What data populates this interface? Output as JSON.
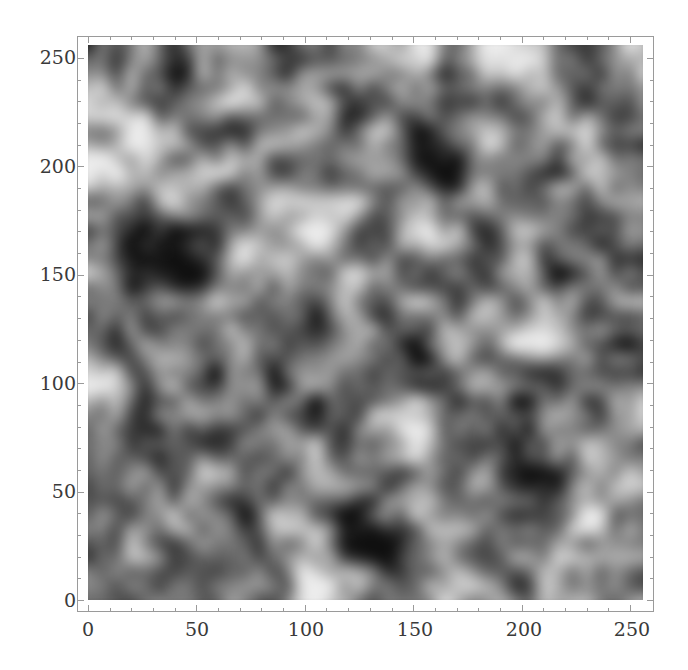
{
  "chart_data": {
    "type": "heatmap",
    "title": "",
    "xlabel": "",
    "ylabel": "",
    "xlim": [
      0,
      256
    ],
    "ylim": [
      0,
      256
    ],
    "x_ticks": [
      "0",
      "50",
      "100",
      "150",
      "200",
      "250"
    ],
    "y_ticks": [
      "0",
      "50",
      "100",
      "150",
      "200",
      "250"
    ],
    "colormap": "grayscale",
    "grid": false,
    "coarse_grid_rows_top_to_bottom": [
      [
        0.35,
        0.55,
        0.3,
        0.5,
        0.55,
        0.3,
        0.4,
        0.45,
        0.55,
        0.7,
        0.35,
        0.65,
        0.7,
        0.45,
        0.35,
        0.6
      ],
      [
        0.6,
        0.45,
        0.25,
        0.5,
        0.7,
        0.45,
        0.55,
        0.35,
        0.4,
        0.5,
        0.25,
        0.35,
        0.5,
        0.55,
        0.3,
        0.45
      ],
      [
        0.55,
        0.7,
        0.5,
        0.35,
        0.4,
        0.6,
        0.5,
        0.3,
        0.55,
        0.2,
        0.45,
        0.6,
        0.4,
        0.5,
        0.55,
        0.35
      ],
      [
        0.75,
        0.55,
        0.45,
        0.6,
        0.55,
        0.4,
        0.3,
        0.5,
        0.45,
        0.35,
        0.2,
        0.55,
        0.45,
        0.35,
        0.65,
        0.4
      ],
      [
        0.5,
        0.35,
        0.6,
        0.45,
        0.3,
        0.65,
        0.55,
        0.6,
        0.4,
        0.55,
        0.45,
        0.5,
        0.3,
        0.55,
        0.45,
        0.5
      ],
      [
        0.4,
        0.25,
        0.2,
        0.35,
        0.55,
        0.45,
        0.75,
        0.45,
        0.25,
        0.65,
        0.55,
        0.35,
        0.55,
        0.45,
        0.3,
        0.45
      ],
      [
        0.55,
        0.2,
        0.15,
        0.3,
        0.6,
        0.55,
        0.4,
        0.55,
        0.5,
        0.35,
        0.45,
        0.3,
        0.6,
        0.25,
        0.45,
        0.35
      ],
      [
        0.45,
        0.4,
        0.45,
        0.55,
        0.45,
        0.35,
        0.3,
        0.55,
        0.35,
        0.6,
        0.4,
        0.55,
        0.45,
        0.6,
        0.3,
        0.5
      ],
      [
        0.35,
        0.45,
        0.4,
        0.35,
        0.6,
        0.45,
        0.35,
        0.6,
        0.45,
        0.3,
        0.55,
        0.35,
        0.75,
        0.7,
        0.5,
        0.3
      ],
      [
        0.7,
        0.4,
        0.55,
        0.25,
        0.5,
        0.3,
        0.55,
        0.45,
        0.3,
        0.25,
        0.45,
        0.55,
        0.35,
        0.25,
        0.45,
        0.4
      ],
      [
        0.55,
        0.3,
        0.45,
        0.55,
        0.35,
        0.5,
        0.25,
        0.4,
        0.55,
        0.6,
        0.35,
        0.4,
        0.25,
        0.5,
        0.35,
        0.55
      ],
      [
        0.45,
        0.25,
        0.4,
        0.3,
        0.5,
        0.45,
        0.55,
        0.35,
        0.45,
        0.65,
        0.45,
        0.3,
        0.3,
        0.45,
        0.6,
        0.45
      ],
      [
        0.3,
        0.5,
        0.35,
        0.6,
        0.4,
        0.35,
        0.5,
        0.55,
        0.35,
        0.45,
        0.4,
        0.55,
        0.2,
        0.25,
        0.5,
        0.55
      ],
      [
        0.5,
        0.35,
        0.55,
        0.45,
        0.3,
        0.6,
        0.45,
        0.25,
        0.4,
        0.55,
        0.5,
        0.45,
        0.3,
        0.45,
        0.65,
        0.4
      ],
      [
        0.35,
        0.55,
        0.4,
        0.5,
        0.35,
        0.45,
        0.6,
        0.3,
        0.2,
        0.35,
        0.55,
        0.4,
        0.5,
        0.55,
        0.45,
        0.55
      ],
      [
        0.4,
        0.45,
        0.35,
        0.4,
        0.5,
        0.4,
        0.75,
        0.55,
        0.35,
        0.45,
        0.6,
        0.5,
        0.35,
        0.6,
        0.5,
        0.45
      ]
    ]
  },
  "axes": {
    "x": {
      "ticks": [
        {
          "label": "0",
          "px": 88
        },
        {
          "label": "50",
          "px": 197
        },
        {
          "label": "100",
          "px": 306
        },
        {
          "label": "150",
          "px": 415
        },
        {
          "label": "200",
          "px": 524
        },
        {
          "label": "250",
          "px": 632
        }
      ]
    },
    "y": {
      "ticks": [
        {
          "label": "0",
          "px": 600
        },
        {
          "label": "50",
          "px": 491
        },
        {
          "label": "100",
          "px": 383
        },
        {
          "label": "150",
          "px": 274
        },
        {
          "label": "200",
          "px": 166
        },
        {
          "label": "250",
          "px": 57
        }
      ]
    }
  }
}
